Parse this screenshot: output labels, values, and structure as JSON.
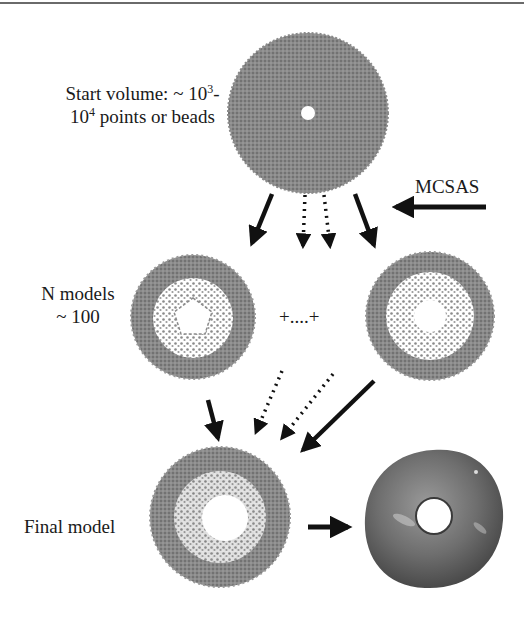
{
  "figure": {
    "labels": {
      "start_volume_line1_prefix": "Start volume: ~ 10",
      "start_volume_line1_sup": "3",
      "start_volume_line1_suffix": "-",
      "start_volume_line2_prefix": "10",
      "start_volume_line2_sup": "4",
      "start_volume_line2_suffix": " points or beads",
      "mcsas": "MCSAS",
      "n_models_line1": "N models",
      "n_models_line2": "~ 100",
      "ellipsis": "+....+",
      "final_model": "Final model"
    },
    "nodes": [
      {
        "id": "start-volume",
        "shape": "filled-disc-with-small-hole"
      },
      {
        "id": "model-1",
        "shape": "ring-of-beads-pentagonal-hole"
      },
      {
        "id": "model-n",
        "shape": "ring-of-beads-round-hole"
      },
      {
        "id": "final-model-beads",
        "shape": "dense-bead-ring"
      },
      {
        "id": "final-model-surface",
        "shape": "rendered-torus-surface"
      }
    ],
    "edges": [
      {
        "from": "mcsas-label",
        "to": "start-volume",
        "style": "solid"
      },
      {
        "from": "start-volume",
        "to": "model-1",
        "style": "solid"
      },
      {
        "from": "start-volume",
        "to": "ellipsis",
        "style": "dotted"
      },
      {
        "from": "start-volume",
        "to": "ellipsis",
        "style": "dotted"
      },
      {
        "from": "start-volume",
        "to": "model-n",
        "style": "solid"
      },
      {
        "from": "model-1",
        "to": "final-model-beads",
        "style": "solid"
      },
      {
        "from": "ellipsis",
        "to": "final-model-beads",
        "style": "dotted"
      },
      {
        "from": "ellipsis",
        "to": "final-model-beads",
        "style": "dotted"
      },
      {
        "from": "model-n",
        "to": "final-model-beads",
        "style": "solid"
      },
      {
        "from": "final-model-beads",
        "to": "final-model-surface",
        "style": "solid"
      }
    ],
    "colors": {
      "bead_gray": "#7d7d7d",
      "surface_gray": "#6e6e6e",
      "arrow": "#111111",
      "text": "#1a1a1a"
    }
  }
}
